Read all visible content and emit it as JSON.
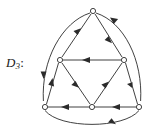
{
  "figure": {
    "label_main": "D",
    "label_subscript": "3",
    "label_colon": ":",
    "caption": "D3:",
    "stroke_color": "#2b2b2b",
    "background_color": "#ffffff",
    "vertex_fill": "#ffffff"
  },
  "graph": {
    "type": "directed-graph",
    "vertex_count": 6,
    "edge_count": 9,
    "vertices": [
      {
        "id": "top",
        "name": "vertex-top",
        "x": 93,
        "y": 11
      },
      {
        "id": "mid-left",
        "name": "vertex-mid-left",
        "x": 60,
        "y": 60
      },
      {
        "id": "mid-right",
        "name": "vertex-mid-right",
        "x": 124,
        "y": 60
      },
      {
        "id": "bottom-left",
        "name": "vertex-bottom-left",
        "x": 45,
        "y": 107
      },
      {
        "id": "bottom-mid",
        "name": "vertex-bottom-middle",
        "x": 92,
        "y": 107
      },
      {
        "id": "bottom-right",
        "name": "vertex-bottom-right",
        "x": 139,
        "y": 107
      }
    ],
    "edges": [
      {
        "id": "e1",
        "name": "edge-midleft-to-top",
        "from": "mid-left",
        "to": "top",
        "shape": "straight",
        "direction": "up-right"
      },
      {
        "id": "e2",
        "name": "edge-top-to-midright",
        "from": "top",
        "to": "mid-right",
        "shape": "straight",
        "direction": "down-right"
      },
      {
        "id": "e3",
        "name": "edge-midright-to-midleft",
        "from": "mid-right",
        "to": "mid-left",
        "shape": "straight",
        "direction": "left"
      },
      {
        "id": "e4",
        "name": "edge-midleft-to-bottommid",
        "from": "mid-left",
        "to": "bottom-mid",
        "shape": "straight",
        "direction": "down-right"
      },
      {
        "id": "e5",
        "name": "edge-bottommid-to-midright",
        "from": "bottom-mid",
        "to": "mid-right",
        "shape": "straight",
        "direction": "up-right"
      },
      {
        "id": "e6",
        "name": "edge-bottomleft-to-midleft",
        "from": "bottom-left",
        "to": "mid-left",
        "shape": "straight",
        "direction": "up-right"
      },
      {
        "id": "e7",
        "name": "edge-midright-to-bottomright",
        "from": "mid-right",
        "to": "bottom-right",
        "shape": "straight",
        "direction": "down-right"
      },
      {
        "id": "e8",
        "name": "edge-bottommid-to-bottomleft",
        "from": "bottom-mid",
        "to": "bottom-left",
        "shape": "straight",
        "direction": "left"
      },
      {
        "id": "e9",
        "name": "edge-bottomright-to-bottommid",
        "from": "bottom-right",
        "to": "bottom-mid",
        "shape": "straight",
        "direction": "left"
      },
      {
        "id": "a1",
        "name": "arc-top-to-bottomleft",
        "from": "top",
        "to": "bottom-left",
        "shape": "arc",
        "direction": "down-left"
      },
      {
        "id": "a2",
        "name": "arc-bottomright-to-top",
        "from": "bottom-right",
        "to": "top",
        "shape": "arc",
        "direction": "up-left"
      },
      {
        "id": "a3",
        "name": "arc-bottomleft-to-bottomright",
        "from": "bottom-left",
        "to": "bottom-right",
        "shape": "arc",
        "direction": "right"
      }
    ]
  }
}
